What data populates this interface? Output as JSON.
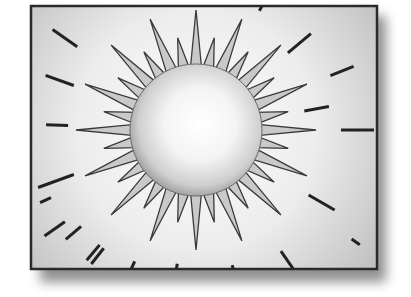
{
  "illustration": {
    "subject": "sun clip-art",
    "colors": {
      "background": "#ffffff",
      "frame_border": "#2a2a2a",
      "frame_fill_edge": "#c4c4c4",
      "frame_fill_center": "#ffffff",
      "ray_fill": "#c8c8c8",
      "ray_stroke": "#3a3a3a",
      "sun_light": "#ffffff",
      "sun_dark": "#a8a8a8",
      "dash_color": "#222222",
      "shadow": "#555555"
    },
    "frame": {
      "x": 31,
      "y": 6,
      "width": 346,
      "height": 263
    },
    "sun": {
      "cx": 196,
      "cy": 130,
      "r": 66
    },
    "rays": {
      "count": 32,
      "long_length": 120,
      "short_length": 94,
      "base_half_angle_deg": 5.2
    }
  }
}
